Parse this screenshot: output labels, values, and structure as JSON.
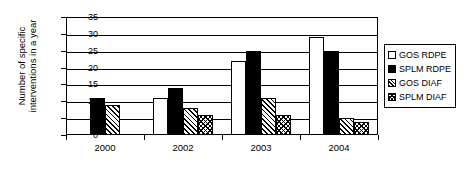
{
  "chart_data": {
    "type": "bar",
    "title": "",
    "xlabel": "",
    "ylabel": "Number of specific\ninterventions in a year",
    "categories": [
      "2000",
      "2002",
      "2003",
      "2004"
    ],
    "series": [
      {
        "name": "GOS RDPE",
        "pattern": "solid-white",
        "values": [
          null,
          11,
          22,
          29
        ]
      },
      {
        "name": "SPLM RDPE",
        "pattern": "solid-black",
        "values": [
          11,
          14,
          25,
          25
        ]
      },
      {
        "name": "GOS DIAF",
        "pattern": "diagonal-hatch",
        "values": [
          9,
          8,
          11,
          5
        ]
      },
      {
        "name": "SPLM DIAF",
        "pattern": "cross-hatch",
        "values": [
          null,
          6,
          6,
          4
        ]
      }
    ],
    "ylim": [
      0,
      35
    ],
    "yticks": [
      0,
      5,
      10,
      15,
      20,
      25,
      30,
      35
    ],
    "ytick_labels": [
      "0",
      "5",
      "10",
      "15",
      "20",
      "25",
      "30",
      "35"
    ],
    "grid": "horizontal",
    "legend_position": "right-outside",
    "legend_entries": [
      "GOS RDPE",
      "SPLM RDPE",
      "GOS DIAF",
      "SPLM DIAF"
    ]
  }
}
